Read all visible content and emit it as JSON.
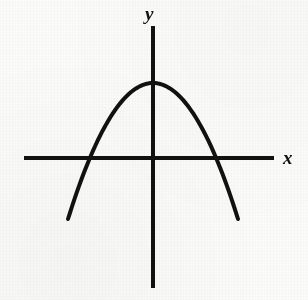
{
  "figure": {
    "background_color": "#fbfbfa",
    "ink_color": "#111111"
  },
  "labels": {
    "y_axis": "y",
    "x_axis": "x"
  },
  "chart_data": {
    "type": "line",
    "title": "",
    "subtitle": "",
    "xlabel": "x",
    "ylabel": "y",
    "grid": false,
    "legend": "none",
    "annotations": [],
    "axes": {
      "x_axis": {
        "label": "x",
        "pixel_y": 158,
        "pixel_x_start": 24,
        "pixel_x_end": 274,
        "stroke_width": 4,
        "label_pixel_x": 289,
        "label_pixel_y": 158
      },
      "y_axis": {
        "label": "y",
        "pixel_x": 153,
        "pixel_y_start": 26,
        "pixel_y_end": 288,
        "stroke_width": 4,
        "label_pixel_x": 152,
        "label_pixel_y": 13
      },
      "origin_pixel": [
        153,
        158
      ],
      "xlim": [
        -4.3,
        4.3
      ],
      "ylim": [
        -2.3,
        3.0
      ]
    },
    "curve": {
      "name": "parabola",
      "equation": "y = x^2 - 2.25",
      "opens": "up",
      "stroke_width": 4,
      "stroke_color": "#111111",
      "vertex": {
        "x": 0,
        "y": -2.25,
        "pixel": [
          153,
          233
        ]
      },
      "x_intercepts": [
        {
          "x": -1.5,
          "y": 0,
          "pixel": [
            78,
            158
          ]
        },
        {
          "x": 1.5,
          "y": 0,
          "pixel": [
            228,
            158
          ]
        }
      ],
      "y_intercept": {
        "x": 0,
        "y": -2.25,
        "pixel": [
          153,
          233
        ]
      },
      "axis_of_symmetry": "x = 0",
      "endpoints": [
        {
          "x": -2.02,
          "y": 1.83,
          "pixel": [
            52,
            76
          ]
        },
        {
          "x": 2.02,
          "y": 1.83,
          "pixel": [
            238,
            76
          ]
        }
      ],
      "x": [
        -2.02,
        -1.8,
        -1.6,
        -1.5,
        -1.3,
        -1.0,
        -0.7,
        -0.4,
        0,
        0.4,
        0.7,
        1.0,
        1.3,
        1.5,
        1.6,
        1.8,
        2.02
      ],
      "y": [
        1.83,
        0.99,
        0.31,
        0.0,
        -0.56,
        -1.25,
        -1.76,
        -2.09,
        -2.25,
        -2.09,
        -1.76,
        -1.25,
        -0.56,
        0.0,
        0.31,
        0.99,
        1.83
      ],
      "pixel_points": [
        [
          52,
          76
        ],
        [
          62,
          105
        ],
        [
          71,
          129
        ],
        [
          78,
          158
        ],
        [
          92,
          178
        ],
        [
          108,
          203
        ],
        [
          121,
          221
        ],
        [
          135,
          233
        ],
        [
          153,
          233
        ],
        [
          171,
          233
        ],
        [
          185,
          221
        ],
        [
          198,
          203
        ],
        [
          214,
          178
        ],
        [
          228,
          158
        ],
        [
          235,
          129
        ],
        [
          244,
          105
        ],
        [
          238,
          76
        ]
      ],
      "path_d": "M 52 76 C 62 120, 96 200, 153 233 C 210 200, 228 120, 238 76"
    }
  }
}
